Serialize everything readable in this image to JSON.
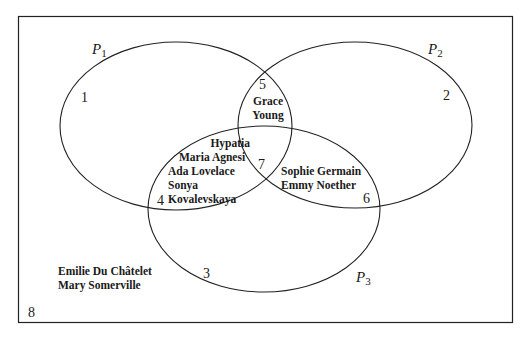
{
  "diagram": {
    "type": "venn",
    "universe_region": "8",
    "sets": [
      {
        "name": "P",
        "subscript": "1"
      },
      {
        "name": "P",
        "subscript": "2"
      },
      {
        "name": "P",
        "subscript": "3"
      }
    ],
    "regions": {
      "r1": {
        "number": "1",
        "names": []
      },
      "r2": {
        "number": "2",
        "names": []
      },
      "r3": {
        "number": "3",
        "names": []
      },
      "r4": {
        "number": "4",
        "names": [
          "Hypatia",
          "Maria Agnesi",
          "Ada Lovelace",
          "Sonya",
          "Kovalevskaya"
        ]
      },
      "r5": {
        "number": "5",
        "names": [
          "Grace",
          "Young"
        ]
      },
      "r6": {
        "number": "6",
        "names": [
          "Sophie Germain",
          "Emmy Noether"
        ]
      },
      "r7": {
        "number": "7",
        "names": []
      },
      "r8": {
        "number": "8",
        "names": [
          "Emilie Du Châtelet",
          "Mary Somerville"
        ]
      }
    }
  }
}
